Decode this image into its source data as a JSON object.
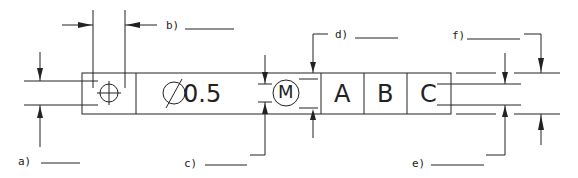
{
  "diagram": {
    "type": "gdt-feature-control-frame",
    "frame": {
      "symbol": "position-icon",
      "tolerance": "Ø 0.5",
      "diameter_symbol": "Ø",
      "tolerance_value": "0.5",
      "modifier": "M",
      "datums": [
        "A",
        "B",
        "C"
      ]
    },
    "callouts": [
      {
        "id": "a",
        "label": "a)"
      },
      {
        "id": "b",
        "label": "b)"
      },
      {
        "id": "c",
        "label": "c)"
      },
      {
        "id": "d",
        "label": "d)"
      },
      {
        "id": "e",
        "label": "e)"
      },
      {
        "id": "f",
        "label": "f)"
      }
    ],
    "line_color": "#222222"
  }
}
